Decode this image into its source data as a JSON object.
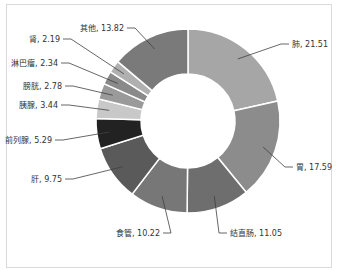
{
  "chart_data": {
    "type": "pie",
    "variant": "donut",
    "title": "",
    "categories": [
      "肺",
      "胃",
      "结直肠",
      "食管",
      "肝",
      "前列腺",
      "胰腺",
      "膀胱",
      "淋巴瘤",
      "肾",
      "其他"
    ],
    "values": [
      21.51,
      17.59,
      11.05,
      10.22,
      9.75,
      5.29,
      3.44,
      2.78,
      2.34,
      2.19,
      13.82
    ],
    "colors": [
      "#a6a6a6",
      "#8c8c8c",
      "#6e6e6e",
      "#777777",
      "#5a5a5a",
      "#222222",
      "#c8c8c8",
      "#9a9a9a",
      "#8a8a8a",
      "#b0b0b0",
      "#7a7a7a"
    ],
    "labels": [
      "肺, 21.51",
      "胃, 17.59",
      "结直肠, 11.05",
      "食管, 10.22",
      "肝, 9.75",
      "前列腺, 5.29",
      "胰腺, 3.44",
      "膀胱, 2.78",
      "淋巴瘤, 2.34",
      "肾, 2.19",
      "其他, 13.82"
    ],
    "legend": "none",
    "start_angle_deg": 0,
    "direction": "clockwise"
  }
}
